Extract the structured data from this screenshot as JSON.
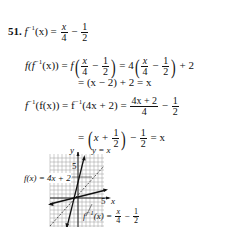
{
  "problem": {
    "number": "51.",
    "inverse_def": {
      "lhs": "f",
      "lhs_sup": "−1",
      "lhs_arg": "(x)",
      "eq": "=",
      "num1": "x",
      "den1": "4",
      "minus": "−",
      "num2": "1",
      "den2": "2"
    },
    "comp1": {
      "lhs": "f(f",
      "lhs_sup": "−1",
      "lhs_tail": "(x))",
      "eq": "=",
      "f_open": "f",
      "inner_num1": "x",
      "inner_den1": "4",
      "minus": "−",
      "inner_num2": "1",
      "inner_den2": "2",
      "eq2": "= 4",
      "plus2": "+ 2"
    },
    "comp1_line2": "= (x − 2) + 2 = x",
    "comp2": {
      "lhs": "f",
      "lhs_sup": "−1",
      "lhs_tail": "(f(x))",
      "eq": "= f",
      "rhs_sup": "−1",
      "rhs_tail": "(4x + 2) =",
      "num": "4x + 2",
      "den": "4",
      "minus": "−",
      "num2": "1",
      "den2": "2"
    },
    "comp2_line2": {
      "eq": "=",
      "x_plus": "x +",
      "n": "1",
      "d": "2",
      "minus": "−",
      "n2": "1",
      "d2": "2",
      "tail": "= x"
    }
  },
  "figure": {
    "y_axis_label": "y",
    "x_axis_label": "x",
    "tick_y": "5",
    "tick_x": "5",
    "line_identity_label": "y = x",
    "f_label": "f(x) = 4x + 2",
    "finv_label_prefix": "f",
    "finv_label_sup": "−1",
    "finv_label_mid": "(x) =",
    "finv_num1": "x",
    "finv_den1": "4",
    "finv_minus": "−",
    "finv_num2": "1",
    "finv_den2": "2"
  }
}
